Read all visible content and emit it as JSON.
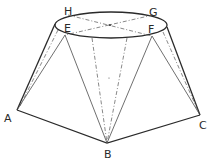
{
  "diagram": {
    "type": "geometric-construction",
    "points": {
      "A": {
        "label": "A",
        "x": 17,
        "y": 110
      },
      "B": {
        "label": "B",
        "x": 107,
        "y": 143
      },
      "C": {
        "label": "C",
        "x": 200,
        "y": 115
      },
      "E": {
        "label": "E",
        "x": 65,
        "y": 35
      },
      "F": {
        "label": "F",
        "x": 152,
        "y": 36
      },
      "G": {
        "label": "G",
        "x": 153,
        "y": 14
      },
      "H": {
        "label": "H",
        "x": 68,
        "y": 13
      }
    },
    "labels": {
      "A": "A",
      "B": "B",
      "C": "C",
      "E": "E",
      "F": "F",
      "G": "G",
      "H": "H"
    },
    "colors": {
      "line": "#2a2a2a",
      "background": "#ffffff"
    }
  }
}
